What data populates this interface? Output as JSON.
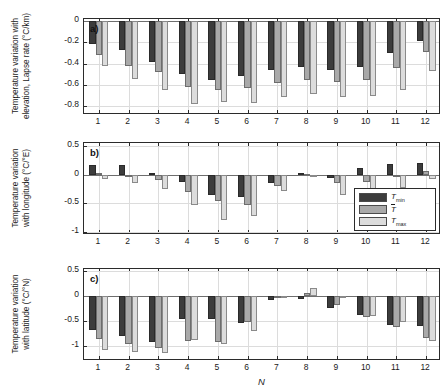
{
  "figure": {
    "xlabel": "N",
    "background": "#ffffff",
    "series_colors": [
      "#3c3c3c",
      "#a9a9a9",
      "#dcdcdc"
    ]
  },
  "legend": {
    "position": "inside-panel-b-bottom-right",
    "items": [
      {
        "label_base": "T",
        "label_sub": "min",
        "overbar": false,
        "color": "#3c3c3c"
      },
      {
        "label_base": "T",
        "label_sub": "",
        "overbar": true,
        "color": "#a9a9a9"
      },
      {
        "label_base": "T",
        "label_sub": "max",
        "overbar": false,
        "color": "#dcdcdc"
      }
    ]
  },
  "panels": [
    {
      "tag": "a)",
      "ylabel_line1": "Temperature variation with",
      "ylabel_line2": "elevation, Lapse rate (°C/km)",
      "yticks": [
        0,
        -0.2,
        -0.4,
        -0.6,
        -0.8
      ],
      "ytick_labels": [
        "0",
        "-0.2",
        "-0.4",
        "-0.6",
        "-0.8"
      ],
      "ylim": [
        -0.88,
        0.02
      ],
      "xticks": [
        1,
        2,
        3,
        4,
        5,
        6,
        7,
        8,
        9,
        10,
        11,
        12
      ],
      "xtick_labels": [
        "1",
        "2",
        "3",
        "4",
        "5",
        "6",
        "7",
        "8",
        "9",
        "10",
        "11",
        "12"
      ]
    },
    {
      "tag": "b)",
      "ylabel_line1": "Temperature variation",
      "ylabel_line2": "with longitude (°C/°E)",
      "yticks": [
        0.5,
        0,
        -0.5,
        -1
      ],
      "ytick_labels": [
        "0.5",
        "0",
        "-0.5",
        "-1"
      ],
      "ylim": [
        -1.05,
        0.55
      ],
      "xticks": [
        1,
        2,
        3,
        4,
        5,
        6,
        7,
        8,
        9,
        10,
        11,
        12
      ],
      "xtick_labels": [
        "1",
        "2",
        "3",
        "4",
        "5",
        "6",
        "7",
        "8",
        "9",
        "10",
        "11",
        "12"
      ]
    },
    {
      "tag": "c)",
      "ylabel_line1": "Temperature variation",
      "ylabel_line2": "with latitude (°C/°N)",
      "yticks": [
        0.5,
        0,
        -0.5,
        -1
      ],
      "ytick_labels": [
        "0.5",
        "0",
        "-0.5",
        "-1"
      ],
      "ylim": [
        -1.3,
        0.55
      ],
      "xticks": [
        1,
        2,
        3,
        4,
        5,
        6,
        7,
        8,
        9,
        10,
        11,
        12
      ],
      "xtick_labels": [
        "1",
        "2",
        "3",
        "4",
        "5",
        "6",
        "7",
        "8",
        "9",
        "10",
        "11",
        "12"
      ]
    }
  ],
  "chart_data": [
    {
      "type": "bar",
      "panel": "a",
      "title": "",
      "xlabel": "N",
      "ylabel": "Temperature variation with elevation, Lapse rate (°C/km)",
      "categories": [
        "1",
        "2",
        "3",
        "4",
        "5",
        "6",
        "7",
        "8",
        "9",
        "10",
        "11",
        "12"
      ],
      "ylim": [
        -0.88,
        0.02
      ],
      "grid": true,
      "series": [
        {
          "name": "T_min",
          "values": [
            -0.21,
            -0.27,
            -0.38,
            -0.5,
            -0.55,
            -0.51,
            -0.46,
            -0.43,
            -0.46,
            -0.43,
            -0.3,
            -0.19
          ]
        },
        {
          "name": "T_mean",
          "values": [
            -0.32,
            -0.42,
            -0.48,
            -0.62,
            -0.65,
            -0.63,
            -0.58,
            -0.55,
            -0.57,
            -0.55,
            -0.44,
            -0.29
          ]
        },
        {
          "name": "T_max",
          "values": [
            -0.42,
            -0.54,
            -0.65,
            -0.78,
            -0.76,
            -0.77,
            -0.71,
            -0.68,
            -0.71,
            -0.7,
            -0.65,
            -0.47
          ]
        }
      ]
    },
    {
      "type": "bar",
      "panel": "b",
      "title": "",
      "xlabel": "N",
      "ylabel": "Temperature variation with longitude (°C/°E)",
      "categories": [
        "1",
        "2",
        "3",
        "4",
        "5",
        "6",
        "7",
        "8",
        "9",
        "10",
        "11",
        "12"
      ],
      "ylim": [
        -1.05,
        0.55
      ],
      "grid": true,
      "series": [
        {
          "name": "T_min",
          "values": [
            0.16,
            0.16,
            0.02,
            -0.13,
            -0.36,
            -0.39,
            -0.15,
            0.02,
            -0.05,
            0.12,
            0.18,
            0.2
          ]
        },
        {
          "name": "T_mean",
          "values": [
            0.03,
            -0.01,
            -0.1,
            -0.3,
            -0.45,
            -0.53,
            -0.2,
            0.01,
            -0.14,
            -0.13,
            -0.01,
            0.06
          ]
        },
        {
          "name": "T_max",
          "values": [
            -0.08,
            -0.14,
            -0.25,
            -0.52,
            -0.79,
            -0.72,
            -0.28,
            -0.03,
            -0.35,
            -0.38,
            -0.23,
            -0.08
          ]
        }
      ]
    },
    {
      "type": "bar",
      "panel": "c",
      "title": "",
      "xlabel": "N",
      "ylabel": "Temperature variation with latitude (°C/°N)",
      "categories": [
        "1",
        "2",
        "3",
        "4",
        "5",
        "6",
        "7",
        "8",
        "9",
        "10",
        "11",
        "12"
      ],
      "ylim": [
        -1.3,
        0.55
      ],
      "grid": true,
      "series": [
        {
          "name": "T_min",
          "values": [
            -0.68,
            -0.8,
            -0.92,
            -0.46,
            -0.45,
            -0.53,
            -0.08,
            -0.05,
            -0.24,
            -0.38,
            -0.58,
            -0.6
          ]
        },
        {
          "name": "T_mean",
          "values": [
            -0.85,
            -0.95,
            -1.03,
            -0.9,
            -0.92,
            -0.52,
            -0.03,
            0.06,
            -0.18,
            -0.42,
            -0.61,
            -0.84
          ]
        },
        {
          "name": "T_max",
          "values": [
            -1.07,
            -1.12,
            -1.13,
            -0.88,
            -0.96,
            -0.7,
            -0.02,
            0.17,
            -0.04,
            -0.4,
            -0.52,
            -0.9
          ]
        }
      ]
    }
  ]
}
